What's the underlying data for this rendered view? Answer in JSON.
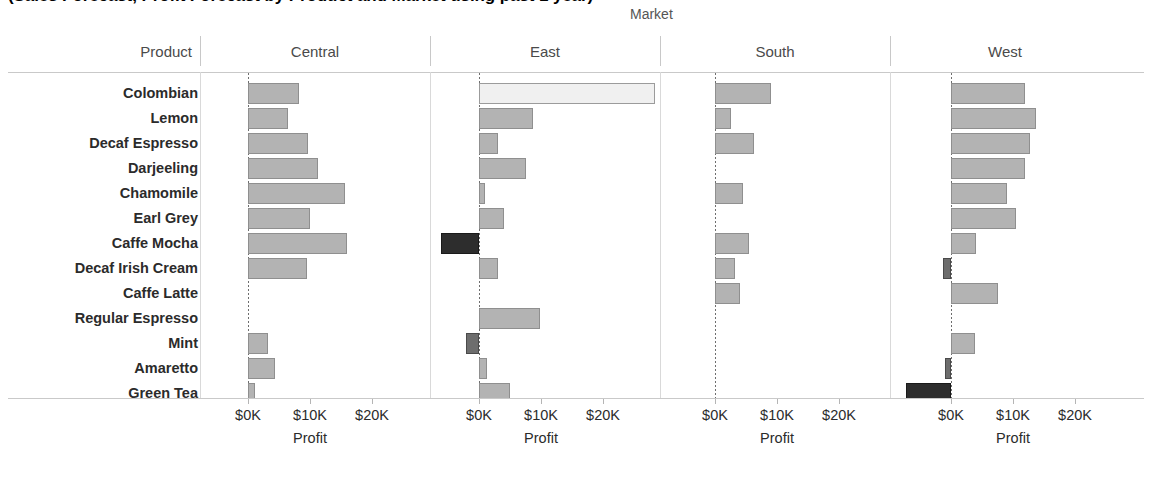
{
  "title": "(Sales Forecast, Profit Forecast by Product and Market using past 1 year)",
  "field_label": "Market",
  "row_header": "Product",
  "axis_title": "Profit",
  "tick_labels": [
    "$0K",
    "$10K",
    "$20K"
  ],
  "tick_values": [
    0,
    10000,
    20000
  ],
  "colors": {
    "positive": "#b3b3b3",
    "negative": "#2d2d2d",
    "negative_mid": "#6d6d6d",
    "highlight": "#f0f0f0",
    "gridline": "#c9c9c9",
    "header_text": "#4a4a4a"
  },
  "chart_data": {
    "type": "bar",
    "title": "(Sales Forecast, Profit Forecast by Product and Market using past 1 year)",
    "orientation": "horizontal",
    "xlabel": "Profit",
    "ylabel": "Product",
    "grid": false,
    "legend": "none",
    "xlim": [
      -10000,
      30000
    ],
    "xticks": [
      0,
      10000,
      20000
    ],
    "xticklabels": [
      "$0K",
      "$10K",
      "$20K"
    ],
    "panel_field": "Market",
    "panels": [
      "Central",
      "East",
      "South",
      "West"
    ],
    "categories": [
      "Colombian",
      "Lemon",
      "Decaf Espresso",
      "Darjeeling",
      "Chamomile",
      "Earl Grey",
      "Caffe Mocha",
      "Decaf Irish Cream",
      "Caffe Latte",
      "Regular Espresso",
      "Mint",
      "Amaretto",
      "Green Tea"
    ],
    "series": [
      {
        "name": "Central",
        "values": [
          8200,
          6500,
          9700,
          11300,
          15600,
          10000,
          16000,
          9500,
          0,
          0,
          3300,
          4400,
          1200
        ]
      },
      {
        "name": "East",
        "values": [
          28400,
          8700,
          3000,
          7600,
          900,
          4000,
          -6100,
          3000,
          0,
          9900,
          -2100,
          1300,
          5000
        ]
      },
      {
        "name": "South",
        "values": [
          9100,
          2600,
          6300,
          0,
          4500,
          0,
          5500,
          3300,
          4100,
          0,
          0,
          0,
          0
        ]
      },
      {
        "name": "West",
        "values": [
          12000,
          13700,
          12800,
          12000,
          9000,
          10500,
          4000,
          -1300,
          7600,
          0,
          3900,
          -900,
          -7200
        ]
      }
    ]
  },
  "panels": [
    {
      "name": "Central",
      "bars": [
        {
          "product": "Colombian",
          "value": 8200,
          "kind": "pos"
        },
        {
          "product": "Lemon",
          "value": 6500,
          "kind": "pos"
        },
        {
          "product": "Decaf Espresso",
          "value": 9700,
          "kind": "pos"
        },
        {
          "product": "Darjeeling",
          "value": 11300,
          "kind": "pos"
        },
        {
          "product": "Chamomile",
          "value": 15600,
          "kind": "pos"
        },
        {
          "product": "Earl Grey",
          "value": 10000,
          "kind": "pos"
        },
        {
          "product": "Caffe Mocha",
          "value": 16000,
          "kind": "pos"
        },
        {
          "product": "Decaf Irish Cream",
          "value": 9500,
          "kind": "pos"
        },
        {
          "product": "Caffe Latte",
          "value": 0,
          "kind": "none"
        },
        {
          "product": "Regular Espresso",
          "value": 0,
          "kind": "none"
        },
        {
          "product": "Mint",
          "value": 3300,
          "kind": "pos"
        },
        {
          "product": "Amaretto",
          "value": 4400,
          "kind": "pos"
        },
        {
          "product": "Green Tea",
          "value": 1200,
          "kind": "pos"
        }
      ]
    },
    {
      "name": "East",
      "bars": [
        {
          "product": "Colombian",
          "value": 28400,
          "kind": "hilite"
        },
        {
          "product": "Lemon",
          "value": 8700,
          "kind": "pos"
        },
        {
          "product": "Decaf Espresso",
          "value": 3000,
          "kind": "pos"
        },
        {
          "product": "Darjeeling",
          "value": 7600,
          "kind": "pos"
        },
        {
          "product": "Chamomile",
          "value": 900,
          "kind": "pos"
        },
        {
          "product": "Earl Grey",
          "value": 4000,
          "kind": "pos"
        },
        {
          "product": "Caffe Mocha",
          "value": -6100,
          "kind": "neg"
        },
        {
          "product": "Decaf Irish Cream",
          "value": 3000,
          "kind": "pos"
        },
        {
          "product": "Caffe Latte",
          "value": 0,
          "kind": "none"
        },
        {
          "product": "Regular Espresso",
          "value": 9900,
          "kind": "pos"
        },
        {
          "product": "Mint",
          "value": -2100,
          "kind": "neg-mid"
        },
        {
          "product": "Amaretto",
          "value": 1300,
          "kind": "pos"
        },
        {
          "product": "Green Tea",
          "value": 5000,
          "kind": "pos"
        }
      ]
    },
    {
      "name": "South",
      "bars": [
        {
          "product": "Colombian",
          "value": 9100,
          "kind": "pos"
        },
        {
          "product": "Lemon",
          "value": 2600,
          "kind": "pos"
        },
        {
          "product": "Decaf Espresso",
          "value": 6300,
          "kind": "pos"
        },
        {
          "product": "Darjeeling",
          "value": 0,
          "kind": "none"
        },
        {
          "product": "Chamomile",
          "value": 4500,
          "kind": "pos"
        },
        {
          "product": "Earl Grey",
          "value": 0,
          "kind": "none"
        },
        {
          "product": "Caffe Mocha",
          "value": 5500,
          "kind": "pos"
        },
        {
          "product": "Decaf Irish Cream",
          "value": 3300,
          "kind": "pos"
        },
        {
          "product": "Caffe Latte",
          "value": 4100,
          "kind": "pos"
        },
        {
          "product": "Regular Espresso",
          "value": 0,
          "kind": "none"
        },
        {
          "product": "Mint",
          "value": 0,
          "kind": "none"
        },
        {
          "product": "Amaretto",
          "value": 0,
          "kind": "none"
        },
        {
          "product": "Green Tea",
          "value": 0,
          "kind": "none"
        }
      ]
    },
    {
      "name": "West",
      "bars": [
        {
          "product": "Colombian",
          "value": 12000,
          "kind": "pos"
        },
        {
          "product": "Lemon",
          "value": 13700,
          "kind": "pos"
        },
        {
          "product": "Decaf Espresso",
          "value": 12800,
          "kind": "pos"
        },
        {
          "product": "Darjeeling",
          "value": 12000,
          "kind": "pos"
        },
        {
          "product": "Chamomile",
          "value": 9000,
          "kind": "pos"
        },
        {
          "product": "Earl Grey",
          "value": 10500,
          "kind": "pos"
        },
        {
          "product": "Caffe Mocha",
          "value": 4000,
          "kind": "pos"
        },
        {
          "product": "Decaf Irish Cream",
          "value": -1300,
          "kind": "neg-mid"
        },
        {
          "product": "Caffe Latte",
          "value": 7600,
          "kind": "pos"
        },
        {
          "product": "Regular Espresso",
          "value": 0,
          "kind": "none"
        },
        {
          "product": "Mint",
          "value": 3900,
          "kind": "pos"
        },
        {
          "product": "Amaretto",
          "value": -900,
          "kind": "neg-mid"
        },
        {
          "product": "Green Tea",
          "value": -7200,
          "kind": "neg"
        }
      ]
    }
  ]
}
